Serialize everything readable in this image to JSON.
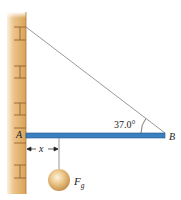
{
  "diagram": {
    "labels": {
      "point_a": "A",
      "point_b": "B",
      "angle": "37.0°",
      "distance": "x",
      "force_main": "F",
      "force_sub": "g"
    },
    "colors": {
      "wall_light": "#f3d7a6",
      "wall_dark": "#d39a4e",
      "brick_line": "#8a5a2a",
      "beam": "#3a7fbf",
      "beam_edge": "#23578a",
      "cable": "#8c8c8c",
      "ball_light": "#fbeccb",
      "ball_dark": "#c89650"
    },
    "geometry": {
      "angle_deg": 37.0
    }
  }
}
